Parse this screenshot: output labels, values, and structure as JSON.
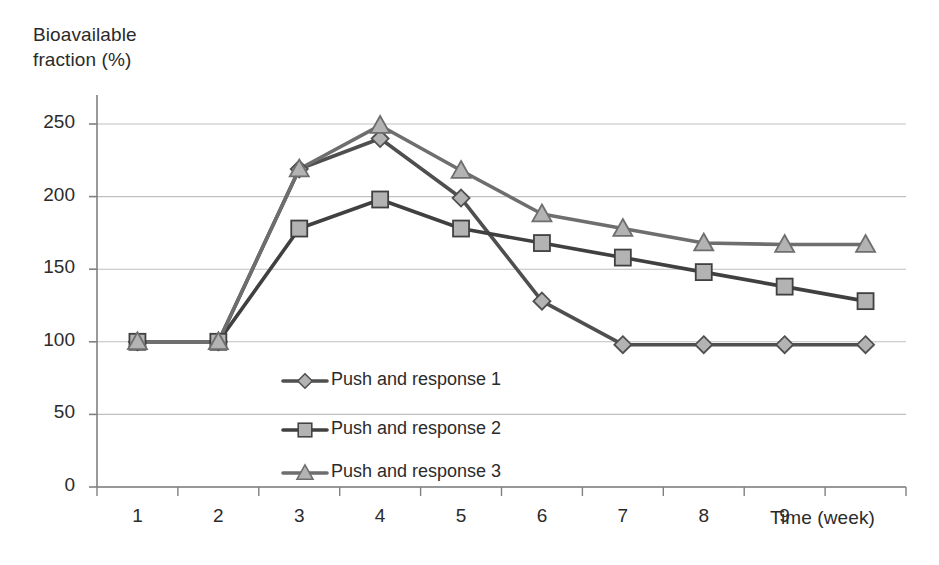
{
  "chart_data": {
    "type": "line",
    "title": "",
    "xlabel": "Time (week)",
    "ylabel": "Bioavailable fraction (%)",
    "x": [
      1,
      2,
      3,
      4,
      5,
      6,
      7,
      8,
      9,
      10
    ],
    "xtick_labels": [
      "1",
      "2",
      "3",
      "4",
      "5",
      "6",
      "7",
      "8",
      "9"
    ],
    "ytick_labels": [
      "0",
      "50",
      "100",
      "150",
      "200",
      "250"
    ],
    "ylim": [
      0,
      270
    ],
    "yticks": [
      0,
      50,
      100,
      150,
      200,
      250
    ],
    "grid": "horizontal",
    "legend_position": "inside-lower-center",
    "series": [
      {
        "name": "Push and response 1",
        "marker": "diamond",
        "color": "#4f4f4f",
        "values": [
          100,
          100,
          219,
          240,
          199,
          128,
          98,
          98,
          98,
          98
        ]
      },
      {
        "name": "Push and response 2",
        "marker": "square",
        "color": "#404040",
        "values": [
          100,
          100,
          178,
          198,
          178,
          168,
          158,
          148,
          138,
          128
        ]
      },
      {
        "name": "Push and response 3",
        "marker": "triangle",
        "color": "#6e6e6e",
        "values": [
          100,
          100,
          219,
          249,
          218,
          188,
          178,
          168,
          167,
          167
        ]
      }
    ]
  },
  "axes": {
    "y_title_line1": "Bioavailable",
    "y_title_line2": "fraction (%)",
    "x_title": "Time (week)"
  },
  "colors": {
    "axis": "#808080",
    "gridline": "#bfbfbf",
    "marker_fill": "#b3b3b3",
    "series1": "#4f4f4f",
    "series2": "#404040",
    "series3": "#6e6e6e",
    "text": "#2b2b2b"
  }
}
